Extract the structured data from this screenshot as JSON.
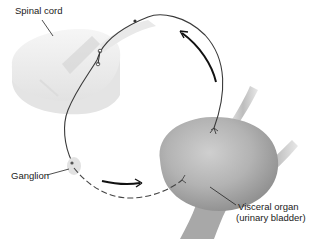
{
  "diagram": {
    "type": "visceral-reflex-arc",
    "labels": {
      "spinal_cord": "Spinal cord",
      "ganglion": "Ganglion",
      "organ_line1": "Visceral organ",
      "organ_line2": "(urinary bladder)"
    },
    "structures": [
      "spinal-cord",
      "ganglion",
      "urinary-bladder",
      "ureter",
      "urethra",
      "sensory-neuron",
      "preganglionic-neuron",
      "postganglionic-neuron"
    ],
    "arrows": [
      {
        "name": "afferent-direction",
        "direction": "bladder-to-spinal-cord"
      },
      {
        "name": "efferent-direction",
        "direction": "ganglion-to-bladder"
      }
    ],
    "colors": {
      "nerve": "#3a3a3a",
      "arrow": "#111111",
      "organ": "#b5b5b5",
      "spinal_cord": "#ececec",
      "background": "#ffffff"
    }
  }
}
